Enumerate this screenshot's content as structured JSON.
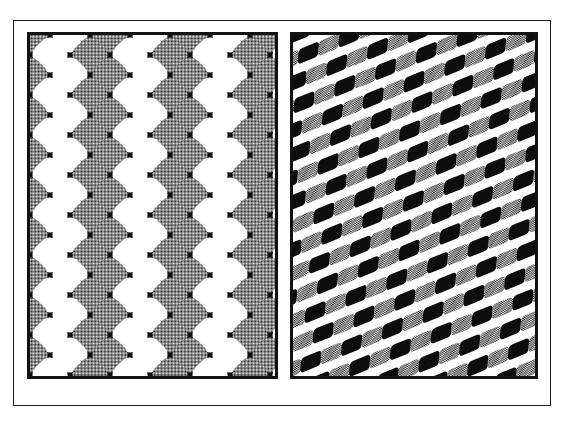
{
  "page": {
    "width": 565,
    "height": 422,
    "background": "#ffffff",
    "ghost_caption": "· · ·  ·"
  },
  "frame": {
    "name": "outer-figure-frame",
    "border_color": "#1a1a1a",
    "border_width_px": 1.5,
    "x": 13,
    "y": 20,
    "width": 538,
    "height": 386
  },
  "panels": [
    {
      "id": "left",
      "label": "checkerboard-lattice",
      "caption": "",
      "x": 27,
      "y": 32,
      "width": 251,
      "height": 347,
      "border_color": "#111111",
      "border_width_px": 3,
      "background": "#0d0d0d",
      "tile_colors": {
        "black": "#0d0d0d",
        "gray": "#9a9a9a",
        "white": "#ffffff"
      },
      "cell_size_px": 40,
      "corner_radius_px": 11,
      "shear_deg": 0,
      "rotation_deg": 0
    },
    {
      "id": "right",
      "label": "sheared-checkerboard-lattice",
      "caption": "",
      "x": 290,
      "y": 32,
      "width": 248,
      "height": 347,
      "border_color": "#111111",
      "border_width_px": 3,
      "background": "#ffffff",
      "tile_colors": {
        "black": "#0d0d0d",
        "gray": "#9a9a9a",
        "white": "#ffffff"
      },
      "cell_size_px": 40,
      "corner_radius_px": 11,
      "shear_deg": -27,
      "rotation_deg": -22
    }
  ],
  "chart_data": {
    "type": "heatmap",
    "title": "",
    "subtitle": "",
    "xlabel": "",
    "ylabel": "",
    "legend": [
      {
        "name": "black field",
        "color": "#0d0d0d"
      },
      {
        "name": "halftone gray tile",
        "color": "#9a9a9a"
      },
      {
        "name": "white tile",
        "color": "#ffffff"
      }
    ],
    "series": [
      {
        "name": "plate-1-tile-colors",
        "grid_cols": 7,
        "grid_rows": 10,
        "values": [
          [
            "gray",
            "white",
            "gray",
            "white",
            "gray",
            "white",
            "gray"
          ],
          [
            "white",
            "gray",
            "white",
            "gray",
            "white",
            "gray",
            "white"
          ],
          [
            "gray",
            "white",
            "gray",
            "white",
            "gray",
            "white",
            "gray"
          ],
          [
            "white",
            "gray",
            "white",
            "gray",
            "white",
            "gray",
            "white"
          ],
          [
            "gray",
            "white",
            "gray",
            "white",
            "gray",
            "white",
            "gray"
          ],
          [
            "white",
            "gray",
            "white",
            "gray",
            "white",
            "gray",
            "white"
          ],
          [
            "gray",
            "white",
            "gray",
            "white",
            "gray",
            "white",
            "gray"
          ],
          [
            "white",
            "gray",
            "white",
            "gray",
            "white",
            "gray",
            "white"
          ],
          [
            "gray",
            "white",
            "gray",
            "white",
            "gray",
            "white",
            "gray"
          ],
          [
            "white",
            "gray",
            "white",
            "gray",
            "white",
            "gray",
            "white"
          ]
        ]
      },
      {
        "name": "plate-2-tile-colors",
        "grid_cols": 7,
        "grid_rows": 10,
        "transform": "shear -27deg then rotate -22deg",
        "values": [
          [
            "gray",
            "black",
            "gray",
            "black",
            "gray",
            "black",
            "gray"
          ],
          [
            "black",
            "gray",
            "black",
            "gray",
            "black",
            "gray",
            "black"
          ],
          [
            "gray",
            "black",
            "gray",
            "black",
            "gray",
            "black",
            "gray"
          ],
          [
            "black",
            "gray",
            "black",
            "gray",
            "black",
            "gray",
            "black"
          ],
          [
            "gray",
            "black",
            "gray",
            "black",
            "gray",
            "black",
            "gray"
          ],
          [
            "black",
            "gray",
            "black",
            "gray",
            "black",
            "gray",
            "black"
          ],
          [
            "gray",
            "black",
            "gray",
            "black",
            "gray",
            "black",
            "gray"
          ],
          [
            "black",
            "gray",
            "black",
            "gray",
            "black",
            "gray",
            "black"
          ],
          [
            "gray",
            "black",
            "gray",
            "black",
            "gray",
            "black",
            "gray"
          ],
          [
            "black",
            "gray",
            "black",
            "gray",
            "black",
            "gray",
            "black"
          ]
        ]
      }
    ],
    "grid": false,
    "legend_position": "none"
  }
}
